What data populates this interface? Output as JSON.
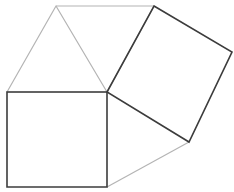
{
  "diagram": {
    "title": "",
    "background": "#ffffff",
    "colors": {
      "dark_stroke": "#3c3c3c",
      "light_stroke": "#b4b4b4"
    },
    "points": {
      "A": [
        7,
        92
      ],
      "B": [
        107,
        92
      ],
      "C": [
        107,
        187
      ],
      "D": [
        7,
        187
      ],
      "E": [
        56,
        6
      ],
      "F": [
        154,
        6
      ],
      "G": [
        232,
        52
      ],
      "H": [
        189,
        142
      ]
    },
    "shapes": [
      {
        "name": "bottom-left-square",
        "type": "polygon",
        "vertices": [
          "A",
          "B",
          "C",
          "D"
        ],
        "stroke": "dark"
      },
      {
        "name": "top-right-square",
        "type": "polygon",
        "vertices": [
          "F",
          "G",
          "H",
          "B"
        ],
        "stroke": "dark"
      },
      {
        "name": "top-triangle",
        "type": "polygon",
        "vertices": [
          "A",
          "E",
          "B"
        ],
        "stroke": "light"
      },
      {
        "name": "top-rhombus-edge",
        "type": "polyline",
        "vertices": [
          "E",
          "F",
          "B"
        ],
        "stroke": "light"
      },
      {
        "name": "bottom-connector",
        "type": "line",
        "vertices": [
          "C",
          "H"
        ],
        "stroke": "light"
      }
    ]
  }
}
